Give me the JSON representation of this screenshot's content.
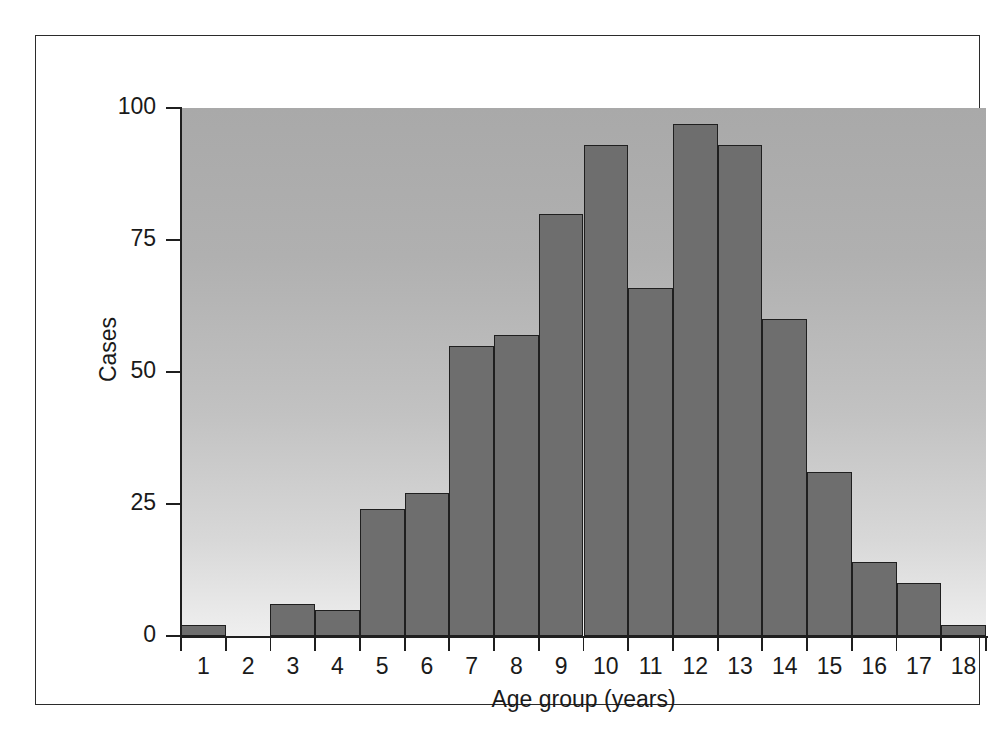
{
  "figure": {
    "frame": true,
    "background_color": "#ffffff",
    "plot_background_top_color": "#a9a9a9",
    "plot_background_bottom_color": "#efefef",
    "bar_fill_color": "#6e6e6e",
    "bar_border_color": "#1f1f1f",
    "axis_color": "#1f1f1f"
  },
  "chart_data": {
    "type": "bar",
    "title": "",
    "subtitle": "",
    "xlabel": "Age group (years)",
    "ylabel": "Cases",
    "categories": [
      "1",
      "2",
      "3",
      "4",
      "5",
      "6",
      "7",
      "8",
      "9",
      "10",
      "11",
      "12",
      "13",
      "14",
      "15",
      "16",
      "17",
      "18"
    ],
    "values": [
      2,
      0,
      6,
      5,
      24,
      27,
      55,
      57,
      80,
      93,
      66,
      97,
      93,
      60,
      31,
      14,
      10,
      2
    ],
    "xlim": [
      0.5,
      18.5
    ],
    "ylim": [
      0,
      100
    ],
    "ytick_labels": [
      "0",
      "25",
      "50",
      "75",
      "100"
    ],
    "ytick_values": [
      0,
      25,
      50,
      75,
      100
    ],
    "xtick_labels": [
      "1",
      "2",
      "3",
      "4",
      "5",
      "6",
      "7",
      "8",
      "9",
      "10",
      "11",
      "12",
      "13",
      "14",
      "15",
      "16",
      "17",
      "18"
    ],
    "grid": false,
    "legend": null,
    "legend_position": "none",
    "annotations": []
  }
}
